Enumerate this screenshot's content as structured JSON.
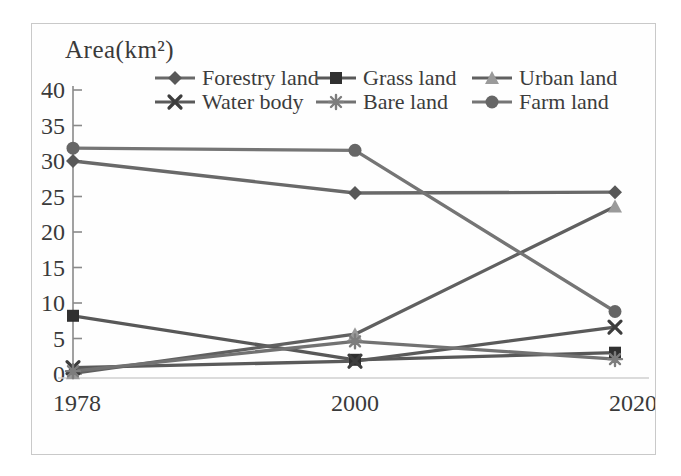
{
  "figure": {
    "background": "#ffffff",
    "frame_border_color": "#c9c9c9",
    "text_color": "#3a3a3a",
    "axis_color": "#8a8a8a",
    "baseline_color": "#cfcfcf"
  },
  "chart_data": {
    "type": "line",
    "title": "Area(km²)",
    "xlabel": "",
    "ylabel": "Area(km²)",
    "x_categories": [
      "1978",
      "2000",
      "2020"
    ],
    "y_ticks": [
      0,
      5,
      10,
      15,
      20,
      25,
      30,
      35,
      40
    ],
    "ylim": [
      0,
      40
    ],
    "grid": false,
    "legend_position": "top",
    "series": [
      {
        "name": "Forestry land",
        "marker": "diamond",
        "line_color": "#696969",
        "marker_color": "#585858",
        "values": [
          30.0,
          25.5,
          25.6
        ]
      },
      {
        "name": "Grass land",
        "marker": "square",
        "line_color": "#585858",
        "marker_color": "#303030",
        "values": [
          8.2,
          2.0,
          3.0
        ]
      },
      {
        "name": "Urban land",
        "marker": "triangle",
        "line_color": "#606060",
        "marker_color": "#9a9a9a",
        "values": [
          0.1,
          5.6,
          23.6
        ]
      },
      {
        "name": "Water body",
        "marker": "x",
        "line_color": "#5a5a5a",
        "marker_color": "#3d3d3d",
        "values": [
          0.9,
          1.8,
          6.6
        ]
      },
      {
        "name": "Bare land",
        "marker": "asterisk",
        "line_color": "#727272",
        "marker_color": "#7d7d7d",
        "values": [
          0.4,
          4.6,
          2.1
        ]
      },
      {
        "name": "Farm land",
        "marker": "circle",
        "line_color": "#757575",
        "marker_color": "#666666",
        "values": [
          31.8,
          31.5,
          8.8
        ]
      }
    ]
  }
}
